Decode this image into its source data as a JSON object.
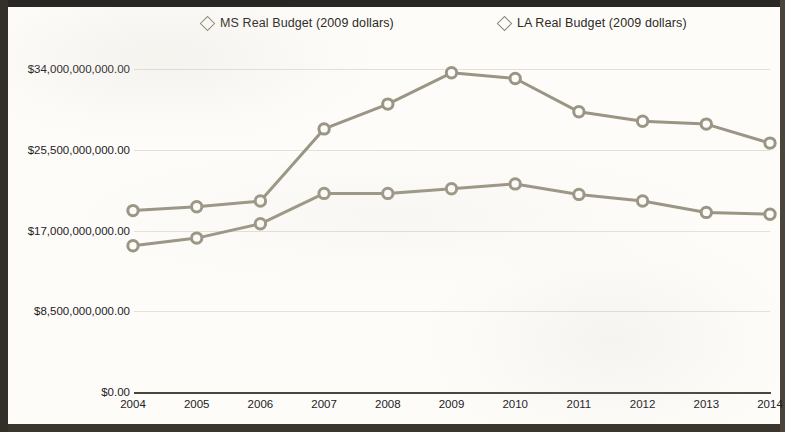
{
  "chart_data": {
    "type": "line",
    "title": "",
    "xlabel": "",
    "ylabel": "",
    "x": [
      2004,
      2005,
      2006,
      2007,
      2008,
      2009,
      2010,
      2011,
      2012,
      2013,
      2014
    ],
    "categories": [
      "2004",
      "2005",
      "2006",
      "2007",
      "2008",
      "2009",
      "2010",
      "2011",
      "2012",
      "2013",
      "2014"
    ],
    "series": [
      {
        "name": "MS Real Budget (2009 dollars)",
        "values": [
          19100000000,
          19500000000,
          20100000000,
          27700000000,
          30300000000,
          33600000000,
          33000000000,
          29500000000,
          28500000000,
          28200000000,
          26200000000
        ]
      },
      {
        "name": "LA Real Budget (2009 dollars)",
        "values": [
          15400000000,
          16200000000,
          17700000000,
          20900000000,
          20900000000,
          21400000000,
          21900000000,
          20800000000,
          20100000000,
          18900000000,
          18700000000
        ]
      }
    ],
    "ylim": [
      0,
      34000000000
    ],
    "ytick_values": [
      0,
      8500000000,
      17000000000,
      25500000000,
      34000000000
    ],
    "ytick_labels": [
      "$0.00",
      "$8,500,000,000.00",
      "$17,000,000,000.00",
      "$25,500,000,000.00",
      "$34,000,000,000.00"
    ],
    "xtick_labels": [
      "2004",
      "2005",
      "2006",
      "2007",
      "2008",
      "2009",
      "2010",
      "2011",
      "2012",
      "2013",
      "2014"
    ],
    "grid": true,
    "legend_position": "top",
    "marker": "diamond-open",
    "series_color": "#9b9585",
    "text_color": "#23211d",
    "background_color": "#fdfcf9"
  },
  "legend": {
    "items": [
      {
        "label": "MS Real Budget (2009 dollars)",
        "marker": "diamond-open"
      },
      {
        "label": "LA Real Budget (2009 dollars)",
        "marker": "diamond-open"
      }
    ]
  }
}
